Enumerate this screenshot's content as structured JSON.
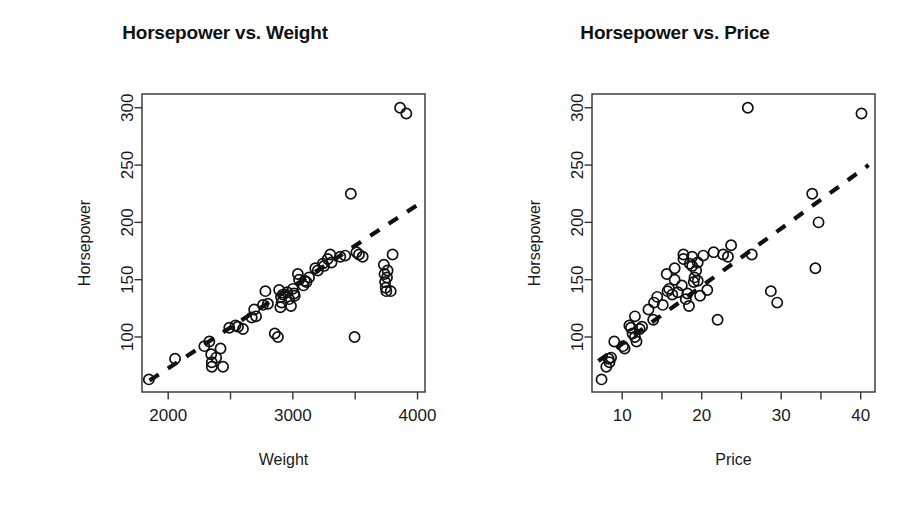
{
  "figure": {
    "background": "#ffffff",
    "point_color": "#111111",
    "line_color": "#111111",
    "axis_color": "#333333"
  },
  "panels": [
    {
      "id": "left",
      "title": "Horsepower vs. Weight",
      "xlabel": "Weight",
      "ylabel": "Horsepower"
    },
    {
      "id": "right",
      "title": "Horsepower vs. Price",
      "xlabel": "Price",
      "ylabel": "Horsepower"
    }
  ],
  "chart_data": [
    {
      "type": "scatter",
      "title": "Horsepower vs. Weight",
      "xlabel": "Weight",
      "ylabel": "Horsepower",
      "xlim": [
        1790,
        4060
      ],
      "ylim": [
        52,
        312
      ],
      "xticks": [
        2000,
        2500,
        3000,
        3500,
        4000
      ],
      "xtick_labels": [
        "2000",
        "",
        "3000",
        "",
        "4000"
      ],
      "yticks": [
        100,
        150,
        200,
        250,
        300
      ],
      "ytick_labels": [
        "100",
        "150",
        "200",
        "250",
        "300"
      ],
      "grid": false,
      "legend": null,
      "marker": "open-circle",
      "trendline": {
        "style": "dashed",
        "x": [
          1850,
          4010
        ],
        "y": [
          62,
          216
        ]
      },
      "x": [
        1845,
        2055,
        2290,
        2330,
        2345,
        2350,
        2350,
        2385,
        2420,
        2440,
        2490,
        2540,
        2560,
        2600,
        2670,
        2690,
        2705,
        2760,
        2780,
        2800,
        2855,
        2880,
        2890,
        2900,
        2905,
        2910,
        2920,
        2955,
        2970,
        2985,
        3000,
        3010,
        3015,
        3040,
        3050,
        3085,
        3095,
        3110,
        3130,
        3180,
        3200,
        3240,
        3250,
        3280,
        3300,
        3310,
        3380,
        3420,
        3465,
        3495,
        3510,
        3530,
        3560,
        3730,
        3735,
        3740,
        3745,
        3750,
        3755,
        3760,
        3785,
        3800,
        3860,
        3910
      ],
      "y": [
        63,
        81,
        92,
        96,
        85,
        78,
        74,
        82,
        90,
        74,
        108,
        110,
        109,
        107,
        117,
        124,
        118,
        128,
        140,
        129,
        103,
        100,
        141,
        126,
        135,
        130,
        137,
        139,
        133,
        127,
        142,
        138,
        136,
        155,
        150,
        145,
        149,
        148,
        152,
        160,
        158,
        164,
        162,
        168,
        172,
        165,
        170,
        171,
        225,
        100,
        174,
        172,
        170,
        163,
        155,
        148,
        143,
        140,
        152,
        158,
        140,
        172,
        300,
        295
      ]
    },
    {
      "type": "scatter",
      "title": "Horsepower vs. Price",
      "xlabel": "Price",
      "ylabel": "Horsepower",
      "xlim": [
        6.2,
        41.8
      ],
      "ylim": [
        52,
        312
      ],
      "xticks": [
        10,
        15,
        20,
        25,
        30,
        35,
        40
      ],
      "xtick_labels": [
        "10",
        "",
        "20",
        "",
        "30",
        "",
        "40"
      ],
      "yticks": [
        100,
        150,
        200,
        250,
        300
      ],
      "ytick_labels": [
        "100",
        "150",
        "200",
        "250",
        "300"
      ],
      "grid": false,
      "legend": null,
      "marker": "open-circle",
      "trendline": {
        "style": "dashed",
        "x": [
          7.0,
          41.0
        ],
        "y": [
          79,
          250
        ]
      },
      "x": [
        7.4,
        8.0,
        8.3,
        8.4,
        8.6,
        9.0,
        10.1,
        10.3,
        10.9,
        11.1,
        11.3,
        11.6,
        11.6,
        11.8,
        12.2,
        12.5,
        13.3,
        13.9,
        14.0,
        14.4,
        15.1,
        15.6,
        15.7,
        15.9,
        16.3,
        16.6,
        16.6,
        17.0,
        17.5,
        17.7,
        17.7,
        18.0,
        18.2,
        18.4,
        18.5,
        18.8,
        18.8,
        19.0,
        19.1,
        19.3,
        19.5,
        19.5,
        19.8,
        20.2,
        20.7,
        21.5,
        22.0,
        22.7,
        23.3,
        23.7,
        25.8,
        26.3,
        28.7,
        29.5,
        33.9,
        34.3,
        34.7,
        40.1
      ],
      "y": [
        63,
        74,
        81,
        78,
        82,
        96,
        92,
        90,
        110,
        108,
        103,
        100,
        118,
        96,
        107,
        109,
        124,
        115,
        130,
        135,
        128,
        155,
        140,
        142,
        137,
        160,
        150,
        139,
        145,
        168,
        172,
        133,
        138,
        127,
        164,
        162,
        170,
        148,
        152,
        158,
        149,
        165,
        136,
        171,
        141,
        174,
        115,
        172,
        170,
        180,
        300,
        172,
        140,
        130,
        225,
        160,
        200,
        295
      ]
    }
  ]
}
